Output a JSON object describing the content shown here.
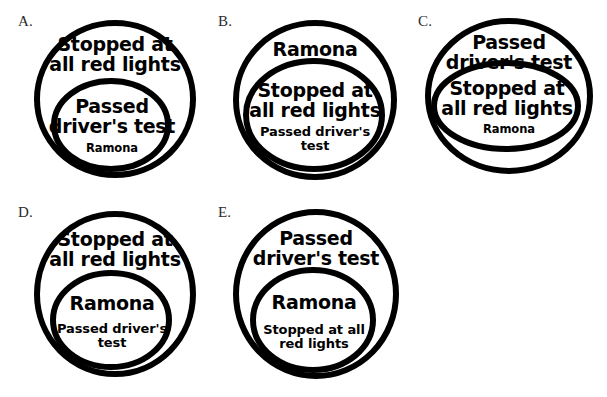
{
  "page": {
    "width": 607,
    "height": 397,
    "background_color": "#ffffff",
    "stroke_color": "#000000"
  },
  "propositions": {
    "stopped": "Stopped at\nall red lights",
    "passed": "Passed\ndriver's test",
    "ramona": "Ramona",
    "passed_small": "Passed driver's\ntest",
    "stopped_small": "Stopped at all\nred lights",
    "ramona_small": "Ramona"
  },
  "options": [
    {
      "label": "A.",
      "outer_text": "Stopped at\nall red lights",
      "inner_text_main": "Passed\ndriver's test",
      "inner_text_sub": "Ramona"
    },
    {
      "label": "B.",
      "outer_text": "Ramona",
      "inner_text_main": "Stopped at\nall red lights",
      "inner_text_sub": "Passed driver's\ntest"
    },
    {
      "label": "C.",
      "outer_text": "Passed\ndriver's test",
      "inner_text_main": "Stopped at\nall red lights",
      "inner_text_sub": "Ramona"
    },
    {
      "label": "D.",
      "outer_text": "Stopped at\nall red lights",
      "inner_text_main": "Ramona",
      "inner_text_sub": "Passed driver's\ntest"
    },
    {
      "label": "E.",
      "outer_text": "Passed\ndriver's test",
      "inner_text_main": "Ramona",
      "inner_text_sub": "Stopped at all\nred lights"
    }
  ]
}
